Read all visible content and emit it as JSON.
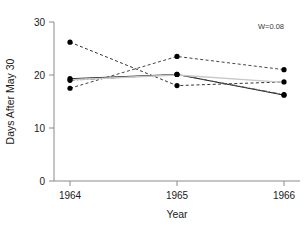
{
  "chart_data": {
    "type": "line",
    "title": "",
    "xlabel": "Year",
    "ylabel": "Days After May 30",
    "categories": [
      "1964",
      "1965",
      "1966"
    ],
    "x": [
      1964,
      1965,
      1966
    ],
    "xlim": [
      1963.75,
      1966.25
    ],
    "ylim": [
      0,
      30
    ],
    "yticks": [
      0,
      10,
      20,
      30
    ],
    "ytick_labels": [
      "0",
      "10",
      "20",
      "30"
    ],
    "xtick_labels": [
      "1964",
      "1965",
      "1966"
    ],
    "grid": false,
    "legend": false,
    "annotations": [
      {
        "text": "W=0.08",
        "x": 1966.0,
        "y": 28.6,
        "position": "top-right"
      }
    ],
    "series": [
      {
        "name": "series-1",
        "style": "dashed",
        "color": "#333333",
        "values": [
          26.2,
          18.0,
          18.7
        ]
      },
      {
        "name": "series-2",
        "style": "dashed",
        "color": "#444444",
        "values": [
          17.5,
          23.5,
          21.0
        ]
      },
      {
        "name": "series-3",
        "style": "solid",
        "color": "#111111",
        "values": [
          19.3,
          20.1,
          16.2
        ]
      },
      {
        "name": "series-4",
        "style": "dashdot",
        "color": "#555555",
        "values": [
          19.0,
          20.1,
          16.3
        ]
      },
      {
        "name": "series-5",
        "style": "solid",
        "color": "#c8c8c8",
        "values": [
          19.1,
          20.0,
          18.6
        ]
      }
    ]
  },
  "colors": {
    "axis": "#8a8a8a",
    "text": "#1a1a1a",
    "marker": "#000000",
    "annotation": "#3a3a3a",
    "background": "#ffffff"
  }
}
